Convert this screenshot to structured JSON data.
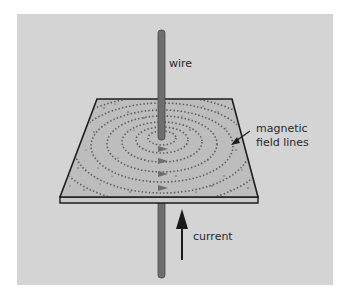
{
  "diagram": {
    "labels": {
      "wire": "wire",
      "field_line1": "magnetic",
      "field_line2": "field lines",
      "current": "current"
    },
    "colors": {
      "background": "#d4d4d4",
      "page": "#ffffff",
      "board": "#bdbdbd",
      "board_edge": "#c9c9c9",
      "outline": "#1e1e1e",
      "wire": "#6e6e6e",
      "wire_edge": "#4a4a4a",
      "dots": "#5a5a5a",
      "arrow": "#1a1a1a",
      "text": "#2a2a2a"
    },
    "icons": {
      "current_arrow": "arrow-up-icon",
      "pointer_arrow": "arrow-left-down-icon",
      "direction_markers": "chevron-right-icon"
    }
  }
}
